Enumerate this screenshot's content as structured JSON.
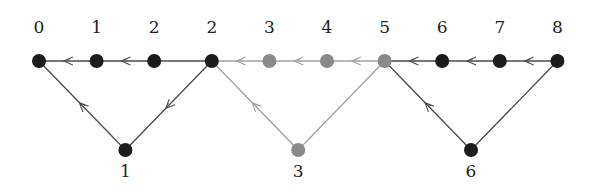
{
  "diagram": {
    "colors": {
      "dark_node": "#1c1c1c",
      "gray_node": "#8a8a8a",
      "dark_edge": "#4a4a4a",
      "gray_edge": "#a0a0a0",
      "label": "#222222"
    },
    "top_nodes": [
      {
        "id": "t0",
        "label": "0",
        "shade": "dark"
      },
      {
        "id": "t1",
        "label": "1",
        "shade": "dark"
      },
      {
        "id": "t2",
        "label": "2",
        "shade": "dark"
      },
      {
        "id": "t3",
        "label": "2",
        "shade": "dark"
      },
      {
        "id": "t4",
        "label": "3",
        "shade": "gray"
      },
      {
        "id": "t5",
        "label": "4",
        "shade": "gray"
      },
      {
        "id": "t6",
        "label": "5",
        "shade": "gray"
      },
      {
        "id": "t7",
        "label": "6",
        "shade": "dark"
      },
      {
        "id": "t8",
        "label": "7",
        "shade": "dark"
      },
      {
        "id": "t9",
        "label": "8",
        "shade": "dark"
      }
    ],
    "bottom_nodes": [
      {
        "id": "b1",
        "label": "1",
        "shade": "dark"
      },
      {
        "id": "b3",
        "label": "3",
        "shade": "gray"
      },
      {
        "id": "b6",
        "label": "6",
        "shade": "dark"
      }
    ],
    "edges": [
      {
        "from": "t1",
        "to": "t0",
        "shade": "dark",
        "arrow": true
      },
      {
        "from": "t2",
        "to": "t1",
        "shade": "dark",
        "arrow": true
      },
      {
        "from": "t3",
        "to": "t2",
        "shade": "dark",
        "arrow": false
      },
      {
        "from": "t4",
        "to": "t3",
        "shade": "gray",
        "arrow": true
      },
      {
        "from": "t5",
        "to": "t4",
        "shade": "gray",
        "arrow": true
      },
      {
        "from": "t6",
        "to": "t5",
        "shade": "gray",
        "arrow": true
      },
      {
        "from": "t7",
        "to": "t6",
        "shade": "dark",
        "arrow": true
      },
      {
        "from": "t8",
        "to": "t7",
        "shade": "dark",
        "arrow": true
      },
      {
        "from": "t9",
        "to": "t8",
        "shade": "dark",
        "arrow": true
      },
      {
        "from": "t3",
        "to": "b1",
        "shade": "dark",
        "arrow": true
      },
      {
        "from": "b1",
        "to": "t0",
        "shade": "dark",
        "arrow": true
      },
      {
        "from": "t6",
        "to": "b3",
        "shade": "gray",
        "arrow": false
      },
      {
        "from": "b3",
        "to": "t3",
        "shade": "gray",
        "arrow": true
      },
      {
        "from": "t9",
        "to": "b6",
        "shade": "dark",
        "arrow": false
      },
      {
        "from": "b6",
        "to": "t6",
        "shade": "dark",
        "arrow": true
      }
    ]
  }
}
